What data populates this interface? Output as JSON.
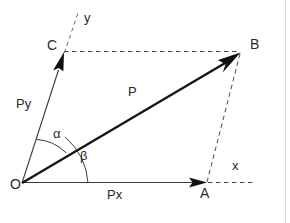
{
  "figure": {
    "background_color": "#ffffff",
    "stroke_color": "#1a1a1a",
    "dashed_color": "#4a4a4a",
    "label_color": "#2b2b2b",
    "border_color": "#d8d8d8"
  },
  "points": {
    "origin": {
      "label": "O",
      "x": 22,
      "y": 183,
      "label_x": 10,
      "label_y": 184
    },
    "a": {
      "label": "A",
      "x": 207,
      "y": 183,
      "label_x": 200,
      "label_y": 186
    },
    "b": {
      "label": "B",
      "x": 240,
      "y": 52,
      "label_x": 250,
      "label_y": 37
    },
    "c": {
      "label": "C",
      "x": 64,
      "y": 52,
      "label_x": 47,
      "label_y": 38
    }
  },
  "axes": {
    "x": {
      "label": "x",
      "label_x": 232,
      "label_y": 160
    },
    "y": {
      "label": "y",
      "label_x": 84,
      "label_y": 12
    }
  },
  "vectors": [
    {
      "name": "resultant",
      "label": "P",
      "label_x": 128,
      "label_y": 86,
      "from": "origin",
      "to": "b"
    },
    {
      "name": "x-component",
      "label": "Px",
      "label_x": 108,
      "label_y": 189,
      "from": "origin",
      "to": "a"
    },
    {
      "name": "y-component",
      "label": "Py",
      "label_x": 16,
      "label_y": 98,
      "from": "origin",
      "to": "c"
    }
  ],
  "angles": [
    {
      "name": "alpha",
      "label": "α",
      "label_x": 53,
      "label_y": 128,
      "between": "Py and P",
      "arc_radius": 46
    },
    {
      "name": "beta",
      "label": "β",
      "label_x": 80,
      "label_y": 150,
      "between": "P and Px",
      "arc_radius": 66
    }
  ],
  "dashed_lines": [
    {
      "name": "c-to-b",
      "from": [
        64,
        52
      ],
      "to": [
        240,
        52
      ]
    },
    {
      "name": "a-to-b",
      "from": [
        207,
        183
      ],
      "to": [
        240,
        52
      ]
    },
    {
      "name": "y-axis-extension",
      "from": [
        62,
        58
      ],
      "to": [
        78,
        14
      ]
    },
    {
      "name": "x-axis-extension",
      "from": [
        207,
        183
      ],
      "to": [
        254,
        183
      ]
    }
  ]
}
